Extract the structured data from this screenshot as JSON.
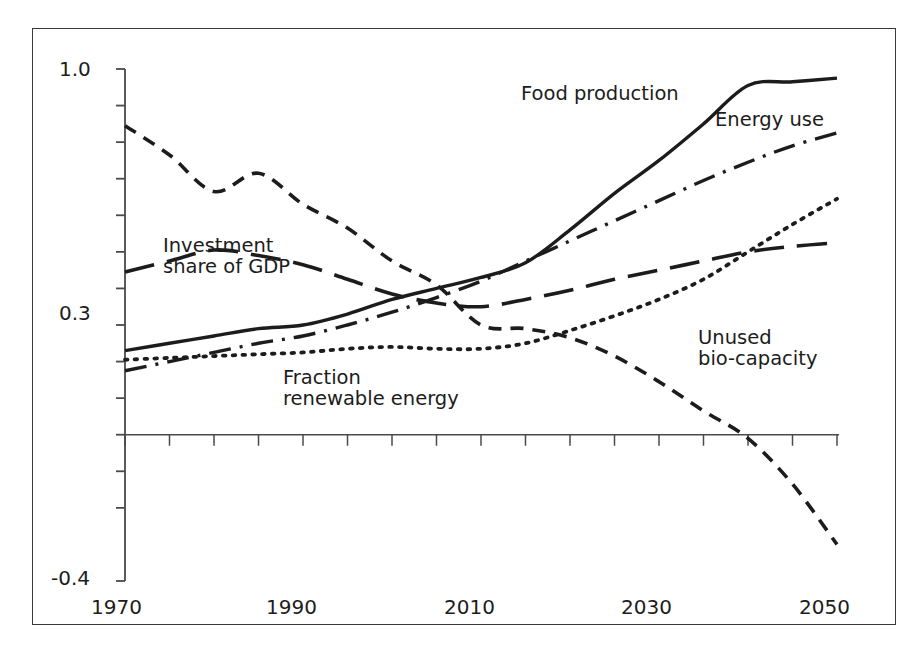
{
  "page": {
    "bleed_text": "",
    "background": "#ffffff",
    "frame_border_color": "#3a3a3a"
  },
  "chart_data": {
    "type": "line",
    "title": "",
    "subtitle": "",
    "xlabel": "",
    "ylabel": "",
    "xlim": [
      1970,
      2050
    ],
    "ylim": [
      -0.4,
      1.0
    ],
    "xticks": [
      1970,
      1975,
      1980,
      1985,
      1990,
      1995,
      2000,
      2005,
      2010,
      2015,
      2020,
      2025,
      2030,
      2035,
      2040,
      2045,
      2050
    ],
    "xtick_labels": [
      "1970",
      "",
      "",
      "",
      "1990",
      "",
      "",
      "",
      "2010",
      "",
      "",
      "",
      "2030",
      "",
      "",
      "",
      "2050"
    ],
    "xtick_labels_shown": [
      "1970",
      "1990",
      "2010",
      "2030",
      "2050"
    ],
    "yticks": [
      -0.4,
      -0.2,
      -0.1,
      0.0,
      0.1,
      0.2,
      0.3,
      0.4,
      0.5,
      0.6,
      0.7,
      0.8,
      0.9,
      1.0
    ],
    "ytick_labels_shown": [
      "1.0",
      "0.3",
      "-0.4"
    ],
    "grid": false,
    "zero_line": true,
    "legend_position": "inline-annotations",
    "series": [
      {
        "name": "Food production",
        "style": "solid",
        "color": "#1c1c1c",
        "label_x": 520,
        "label_y": 82,
        "x": [
          1970,
          1975,
          1980,
          1985,
          1990,
          1995,
          2000,
          2005,
          2010,
          2015,
          2020,
          2025,
          2030,
          2035,
          2040,
          2045,
          2050
        ],
        "values": [
          0.23,
          0.25,
          0.27,
          0.29,
          0.3,
          0.33,
          0.37,
          0.4,
          0.43,
          0.47,
          0.56,
          0.66,
          0.75,
          0.85,
          0.955,
          0.965,
          0.975
        ]
      },
      {
        "name": "Energy use",
        "style": "dash-dot",
        "color": "#1c1c1c",
        "label_x": 714,
        "label_y": 108,
        "x": [
          1970,
          1975,
          1980,
          1985,
          1990,
          1995,
          2000,
          2005,
          2010,
          2015,
          2020,
          2025,
          2030,
          2035,
          2040,
          2045,
          2050
        ],
        "values": [
          0.175,
          0.2,
          0.225,
          0.25,
          0.27,
          0.3,
          0.335,
          0.375,
          0.42,
          0.475,
          0.53,
          0.585,
          0.64,
          0.695,
          0.745,
          0.79,
          0.825
        ]
      },
      {
        "name": "Unused bio-capacity",
        "style": "short-dash",
        "color": "#1c1c1c",
        "label_x": 697,
        "label_y": 326,
        "x": [
          1970,
          1975,
          1980,
          1985,
          1990,
          1995,
          2000,
          2005,
          2010,
          2015,
          2020,
          2025,
          2030,
          2035,
          2040,
          2045,
          2050
        ],
        "values": [
          0.845,
          0.765,
          0.665,
          0.715,
          0.63,
          0.565,
          0.475,
          0.41,
          0.3,
          0.29,
          0.265,
          0.215,
          0.145,
          0.065,
          -0.01,
          -0.135,
          -0.3
        ]
      },
      {
        "name": "Investment share of GDP",
        "style": "long-dash",
        "color": "#1c1c1c",
        "label_x": 162,
        "label_y": 232,
        "x": [
          1970,
          1975,
          1980,
          1985,
          1990,
          1995,
          2000,
          2005,
          2010,
          2015,
          2020,
          2025,
          2030,
          2035,
          2040,
          2045,
          2050
        ],
        "values": [
          0.445,
          0.475,
          0.505,
          0.49,
          0.465,
          0.425,
          0.385,
          0.36,
          0.35,
          0.37,
          0.395,
          0.425,
          0.45,
          0.475,
          0.5,
          0.515,
          0.525
        ]
      },
      {
        "name": "Fraction renewable energy",
        "style": "dotted",
        "color": "#1c1c1c",
        "label_x": 282,
        "label_y": 362,
        "x": [
          1970,
          1975,
          1980,
          1985,
          1990,
          1995,
          2000,
          2005,
          2010,
          2015,
          2020,
          2025,
          2030,
          2035,
          2040,
          2045,
          2050
        ],
        "values": [
          0.205,
          0.21,
          0.215,
          0.22,
          0.225,
          0.235,
          0.24,
          0.235,
          0.235,
          0.25,
          0.285,
          0.325,
          0.37,
          0.425,
          0.5,
          0.575,
          0.645
        ]
      }
    ]
  },
  "labels": {
    "y_top": "1.0",
    "y_mid": "0.3",
    "y_bottom": "-0.4",
    "x_1970": "1970",
    "x_1990": "1990",
    "x_2010": "2010",
    "x_2030": "2030",
    "x_2050": "2050",
    "s_food": "Food production",
    "s_energy": "Energy use",
    "s_unused_l1": "Unused",
    "s_unused_l2": "bio-capacity",
    "s_invest_l1": "Investment",
    "s_invest_l2": "share of GDP",
    "s_renew_l1": "Fraction",
    "s_renew_l2": "renewable energy"
  }
}
